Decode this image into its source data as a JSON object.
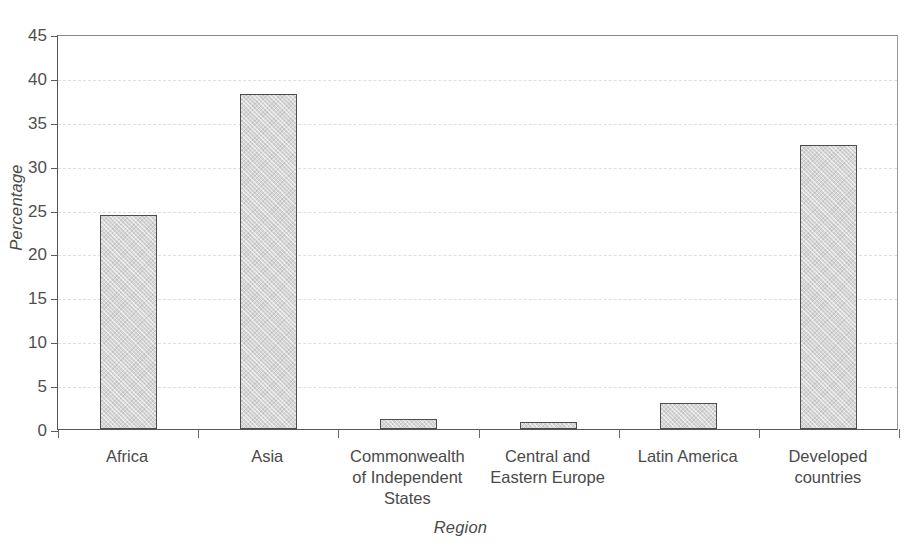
{
  "chart_data": {
    "type": "bar",
    "title": "",
    "subtitle": "",
    "xlabel": "Region",
    "ylabel": "Percentage",
    "categories": [
      "Africa",
      "Commonwealth of Independent States",
      "Asia",
      "Central and Eastern Europe",
      "Latin America",
      "Developed countries"
    ],
    "category_labels": [
      "Africa",
      "Asia",
      "Commonwealth\nof Independent\nStates",
      "Central and\nEastern Europe",
      "Latin America",
      "Developed\ncountries"
    ],
    "values": [
      24.4,
      38.2,
      1.1,
      0.85,
      3.0,
      32.4
    ],
    "ylim": [
      0,
      45
    ],
    "ytick_labels": [
      "0",
      "5",
      "10",
      "15",
      "20",
      "25",
      "30",
      "35",
      "40",
      "45"
    ],
    "ytick_values": [
      0,
      5,
      10,
      15,
      20,
      25,
      30,
      35,
      40,
      45
    ],
    "grid": true,
    "grid_axis": "y",
    "legend": false,
    "legend_position": "none",
    "bar_fill_color": "#d6d6d6",
    "bar_edge_color": "#4d4d4d",
    "grid_color": "#dedede",
    "axis_color": "#555555",
    "text_color": "#4a4a4a"
  }
}
